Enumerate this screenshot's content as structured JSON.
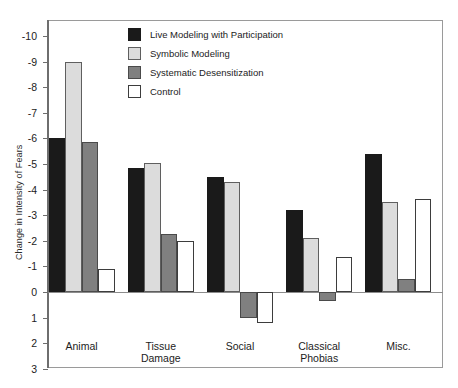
{
  "chart_data": {
    "type": "bar",
    "title": "",
    "xlabel": "",
    "ylabel": "Change in Intensity of Fears",
    "categories": [
      "Animal",
      "Tissue\nDamage",
      "Social",
      "Classical\nPhobias",
      "Misc."
    ],
    "category_lines": [
      [
        "Animal"
      ],
      [
        "Tissue",
        "Damage"
      ],
      [
        "Social"
      ],
      [
        "Classical",
        "Phobias"
      ],
      [
        "Misc."
      ]
    ],
    "ylim": [
      -10,
      3
    ],
    "y_ticks": [
      -10,
      -9,
      -8,
      -7,
      -6,
      -5,
      -4,
      -3,
      -2,
      -1,
      0,
      1,
      2,
      3
    ],
    "y_tick_labels": [
      "-10",
      "-9",
      "-8",
      "-7",
      "-6",
      "-5",
      "-4",
      "-3",
      "-2",
      "-1",
      "0",
      "1",
      "2",
      "3"
    ],
    "y_axis_inverted": true,
    "grid": false,
    "legend_position": "top-center",
    "series": [
      {
        "name": "Live Modeling with Participation",
        "color": "#1a1a1a",
        "values": [
          -6.0,
          -4.85,
          -4.5,
          -3.2,
          -5.4
        ]
      },
      {
        "name": "Symbolic Modeling",
        "color": "#dcdcdc",
        "values": [
          -9.0,
          -5.05,
          -4.3,
          -2.1,
          -3.5
        ]
      },
      {
        "name": "Systematic Desensitization",
        "color": "#808080",
        "values": [
          -5.85,
          -2.25,
          1.0,
          0.35,
          -0.5
        ]
      },
      {
        "name": "Control",
        "color": "#ffffff",
        "values": [
          -0.9,
          -2.0,
          1.2,
          -1.35,
          -3.65
        ]
      }
    ]
  },
  "legend": {
    "entries": [
      {
        "label": "Live Modeling with Participation"
      },
      {
        "label": "Symbolic Modeling"
      },
      {
        "label": "Systematic Desensitization"
      },
      {
        "label": "Control"
      }
    ]
  }
}
